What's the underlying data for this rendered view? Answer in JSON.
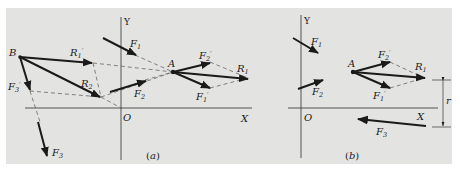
{
  "figure": {
    "background": "#e3e3e1",
    "ink": "#1a1a1a",
    "panels": [
      {
        "id": "a",
        "caption": "(a)",
        "axes": {
          "x_label": "X",
          "y_label": "Y",
          "origin_label": "O"
        },
        "points": {
          "B": "B",
          "A": "A"
        },
        "vectors": {
          "F1": {
            "base": "F",
            "sub": "1",
            "prime": ""
          },
          "F2": {
            "base": "F",
            "sub": "2",
            "prime": ""
          },
          "F3": {
            "base": "F",
            "sub": "3",
            "prime": ""
          },
          "F3p": {
            "base": "F",
            "sub": "3",
            "prime": "′"
          },
          "R1p": {
            "base": "R",
            "sub": "1",
            "prime": "′"
          },
          "R2": {
            "base": "R",
            "sub": "2",
            "prime": ""
          },
          "F1p": {
            "base": "F",
            "sub": "1",
            "prime": "′"
          },
          "F2p": {
            "base": "F",
            "sub": "2",
            "prime": "′"
          },
          "R1": {
            "base": "R",
            "sub": "1",
            "prime": ""
          }
        }
      },
      {
        "id": "b",
        "caption": "(b)",
        "axes": {
          "x_label": "X",
          "y_label": "Y",
          "origin_label": "O"
        },
        "points": {
          "A": "A"
        },
        "vectors": {
          "F1": {
            "base": "F",
            "sub": "1",
            "prime": ""
          },
          "F2": {
            "base": "F",
            "sub": "2",
            "prime": ""
          },
          "F3": {
            "base": "F",
            "sub": "3",
            "prime": ""
          },
          "F1p": {
            "base": "F",
            "sub": "1",
            "prime": "′"
          },
          "F2p": {
            "base": "F",
            "sub": "2",
            "prime": "′"
          },
          "R1": {
            "base": "R",
            "sub": "1",
            "prime": ""
          }
        },
        "dimension": {
          "label": "r"
        }
      }
    ]
  }
}
